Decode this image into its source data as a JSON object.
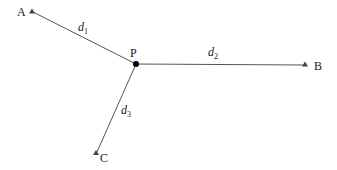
{
  "diagram": {
    "colors": {
      "line": "#555555",
      "marker": "#444444",
      "center": "#000000",
      "text": "#1a1a1a"
    },
    "center": {
      "label": "P",
      "x": 136,
      "y": 64
    },
    "points": [
      {
        "label": "A",
        "x": 32,
        "y": 12
      },
      {
        "label": "B",
        "x": 305,
        "y": 65
      },
      {
        "label": "C",
        "x": 96,
        "y": 153
      }
    ],
    "edges": [
      {
        "from": "P",
        "to": "A",
        "label": "d",
        "subscript": "1"
      },
      {
        "from": "P",
        "to": "B",
        "label": "d",
        "subscript": "2"
      },
      {
        "from": "P",
        "to": "C",
        "label": "d",
        "subscript": "3"
      }
    ]
  }
}
